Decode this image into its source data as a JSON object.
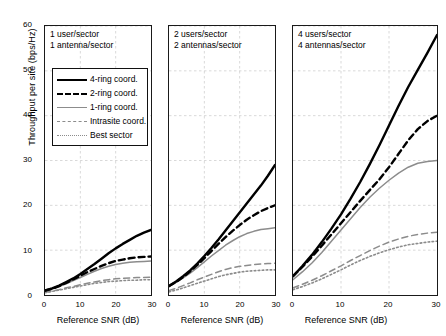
{
  "figure": {
    "ylabel": "Throughput per site (bps/Hz)",
    "xlabel": "Reference SNR (dB)",
    "yticks": [
      "60",
      "50",
      "40",
      "30",
      "20",
      "10",
      "0"
    ],
    "xticks": [
      "0",
      "10",
      "20",
      "30"
    ]
  },
  "legend": {
    "items": [
      {
        "label": "4-ring coord.",
        "style": "solid-black"
      },
      {
        "label": "2-ring coord.",
        "style": "dashed-black"
      },
      {
        "label": "1-ring coord.",
        "style": "solid-gray"
      },
      {
        "label": "Intrasite coord.",
        "style": "dashed-gray"
      },
      {
        "label": "Best sector",
        "style": "dotted-gray"
      }
    ]
  },
  "panels": [
    {
      "title_line1": "1 user/sector",
      "title_line2": "1 antenna/sector"
    },
    {
      "title_line1": "2 users/sector",
      "title_line2": "2 antennas/sector"
    },
    {
      "title_line1": "4 users/sector",
      "title_line2": "4 antennas/sector"
    }
  ],
  "colors": {
    "black": "#000000",
    "gray": "#8c8c8c",
    "grid": "#c9c9c9",
    "axis": "#1a1a1a",
    "background": "#ffffff"
  },
  "chart_data": {
    "type": "line",
    "title": "",
    "xlabel": "Reference SNR (dB)",
    "ylabel": "Throughput per site (bps/Hz)",
    "xlim": [
      0,
      30
    ],
    "ylim": [
      0,
      60
    ],
    "xticks": [
      0,
      10,
      20,
      30
    ],
    "yticks": [
      0,
      10,
      20,
      30,
      40,
      50,
      60
    ],
    "grid": true,
    "legend_position": "upper-left-panel-1",
    "x": [
      0,
      2,
      4,
      6,
      8,
      10,
      12,
      14,
      16,
      18,
      20,
      22,
      24,
      26,
      28,
      30
    ],
    "panels": [
      {
        "name": "1 user/sector, 1 antenna/sector",
        "series": [
          {
            "name": "4-ring coord.",
            "values": [
              1.0,
              1.5,
              2.1,
              2.9,
              3.7,
              4.7,
              5.8,
              6.9,
              8.1,
              9.3,
              10.4,
              11.4,
              12.3,
              13.2,
              13.9,
              14.5
            ]
          },
          {
            "name": "2-ring coord.",
            "values": [
              1.0,
              1.4,
              2.0,
              2.7,
              3.5,
              4.3,
              5.1,
              5.8,
              6.5,
              7.1,
              7.6,
              7.9,
              8.2,
              8.4,
              8.5,
              8.6
            ]
          },
          {
            "name": "1-ring coord.",
            "values": [
              0.9,
              1.3,
              1.9,
              2.5,
              3.2,
              3.9,
              4.6,
              5.3,
              5.9,
              6.4,
              6.8,
              7.1,
              7.3,
              7.4,
              7.5,
              7.6
            ]
          },
          {
            "name": "Intrasite coord.",
            "values": [
              0.6,
              0.9,
              1.2,
              1.6,
              1.9,
              2.3,
              2.6,
              2.9,
              3.2,
              3.4,
              3.6,
              3.7,
              3.8,
              3.9,
              3.9,
              4.0
            ]
          },
          {
            "name": "Best sector",
            "values": [
              0.5,
              0.8,
              1.1,
              1.4,
              1.7,
              2.0,
              2.3,
              2.6,
              2.8,
              3.0,
              3.1,
              3.2,
              3.3,
              3.3,
              3.4,
              3.4
            ]
          }
        ]
      },
      {
        "name": "2 users/sector, 2 antennas/sector",
        "series": [
          {
            "name": "4-ring coord.",
            "values": [
              2.0,
              3.0,
              4.2,
              5.5,
              7.0,
              8.7,
              10.5,
              12.4,
              14.4,
              16.4,
              18.4,
              20.4,
              22.4,
              24.4,
              26.6,
              29.0
            ]
          },
          {
            "name": "2-ring coord.",
            "values": [
              2.0,
              2.9,
              4.0,
              5.3,
              6.7,
              8.2,
              9.8,
              11.4,
              12.9,
              14.3,
              15.6,
              16.8,
              17.8,
              18.7,
              19.4,
              20.0
            ]
          },
          {
            "name": "1-ring coord.",
            "values": [
              1.9,
              2.8,
              3.8,
              4.9,
              6.1,
              7.4,
              8.7,
              9.9,
              11.1,
              12.1,
              13.0,
              13.7,
              14.2,
              14.6,
              14.8,
              15.0
            ]
          },
          {
            "name": "Intrasite coord.",
            "values": [
              1.0,
              1.5,
              2.1,
              2.7,
              3.4,
              4.0,
              4.6,
              5.2,
              5.7,
              6.1,
              6.4,
              6.6,
              6.8,
              6.9,
              7.0,
              7.1
            ]
          },
          {
            "name": "Best sector",
            "values": [
              0.7,
              1.1,
              1.6,
              2.1,
              2.6,
              3.1,
              3.6,
              4.1,
              4.5,
              4.8,
              5.1,
              5.3,
              5.4,
              5.5,
              5.6,
              5.6
            ]
          }
        ]
      },
      {
        "name": "4 users/sector, 4 antennas/sector",
        "series": [
          {
            "name": "4-ring coord.",
            "values": [
              4.2,
              6.5,
              9.0,
              11.8,
              14.8,
              18.0,
              21.5,
              25.2,
              29.2,
              33.4,
              37.8,
              42.2,
              46.4,
              50.2,
              54.0,
              58.0
            ]
          },
          {
            "name": "2-ring coord.",
            "values": [
              4.2,
              6.3,
              8.6,
              11.0,
              13.5,
              16.0,
              18.5,
              21.0,
              23.4,
              25.8,
              28.5,
              31.5,
              34.5,
              37.0,
              38.8,
              40.0
            ]
          },
          {
            "name": "1-ring coord.",
            "values": [
              3.4,
              5.2,
              7.2,
              9.5,
              12.0,
              14.5,
              17.0,
              19.5,
              21.8,
              23.8,
              25.6,
              27.2,
              28.5,
              29.4,
              29.8,
              30.0
            ]
          },
          {
            "name": "Intrasite coord.",
            "values": [
              1.6,
              2.4,
              3.3,
              4.3,
              5.4,
              6.5,
              7.7,
              8.8,
              9.9,
              10.9,
              11.8,
              12.5,
              13.1,
              13.5,
              13.8,
              14.0
            ]
          },
          {
            "name": "Best sector",
            "values": [
              1.2,
              1.9,
              2.7,
              3.6,
              4.6,
              5.6,
              6.7,
              7.7,
              8.6,
              9.4,
              10.1,
              10.7,
              11.2,
              11.5,
              11.8,
              12.0
            ]
          }
        ]
      }
    ]
  }
}
